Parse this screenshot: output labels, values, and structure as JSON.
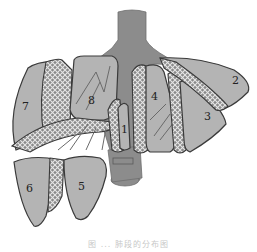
{
  "figure": {
    "caption": "图 ... 肺段的分布图",
    "segments": [
      {
        "id": "segment-1",
        "label": "1"
      },
      {
        "id": "segment-2",
        "label": "2"
      },
      {
        "id": "segment-3",
        "label": "3"
      },
      {
        "id": "segment-4",
        "label": "4"
      },
      {
        "id": "segment-5",
        "label": "5"
      },
      {
        "id": "segment-6",
        "label": "6"
      },
      {
        "id": "segment-7",
        "label": "7"
      },
      {
        "id": "segment-8",
        "label": "8"
      }
    ],
    "colors": {
      "segment_fill": "#b4b4b4",
      "airway_fill": "#8c8c8c",
      "outline": "#3a3a3a",
      "hatch": "#ffffff"
    }
  }
}
